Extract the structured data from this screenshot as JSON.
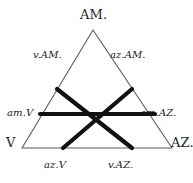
{
  "figure": {
    "kind": "triangular-diagram",
    "width": 193,
    "height": 183,
    "background_color": "#ffffff",
    "thin_line_color": "#555555",
    "thick_line_color": "#111111",
    "text_color": "#1a1a1a"
  },
  "vertices": {
    "apex": "AM.",
    "bottom_left": "V",
    "bottom_right": "AZ."
  },
  "midpoints": {
    "upper_left": "v.AM.",
    "upper_right": "az.AM.",
    "left": "am.V",
    "right": "am.AZ.",
    "lower_left": "az.V",
    "lower_right": "v.AZ."
  },
  "geometry": {
    "outer_triangle": {
      "apex": [
        93,
        30
      ],
      "bottom_left": [
        22,
        148
      ],
      "bottom_right": [
        172,
        148
      ],
      "stroke_width": 1.1
    },
    "medial_triangle": {
      "left_mid": [
        57,
        89
      ],
      "right_mid": [
        132,
        89
      ],
      "bottom_mid": [
        97,
        148
      ],
      "stroke_width": 4.2
    },
    "horizontal_chord": {
      "from": [
        40,
        114
      ],
      "to": [
        155,
        114
      ],
      "stroke_width": 4.2
    },
    "crossing_point": [
      93,
      88
    ]
  }
}
